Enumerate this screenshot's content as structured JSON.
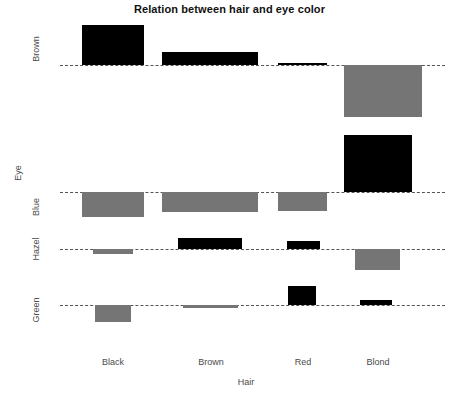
{
  "chart_data": {
    "type": "bar",
    "subtype": "association-plot",
    "title": "Relation between hair and eye color",
    "xlabel": "Hair",
    "ylabel": "Eye",
    "categories": [
      "Black",
      "Brown",
      "Red",
      "Blond"
    ],
    "row_categories": [
      "Brown",
      "Blue",
      "Hazel",
      "Green"
    ],
    "grid": false,
    "legend": null,
    "axis_note": "Dashed horizontal baselines mark zero residual for each eye-color row; black bars point up (positive residual), gray bars point down (negative residual).",
    "series": [
      {
        "name": "Brown",
        "values": [
          12.5,
          5.0,
          0.4,
          -15.7
        ],
        "signs": [
          "positive",
          "positive",
          "positive",
          "negative"
        ]
      },
      {
        "name": "Blue",
        "values": [
          -6.0,
          -4.8,
          -4.4,
          14.0
        ],
        "signs": [
          "negative",
          "negative",
          "negative",
          "positive"
        ]
      },
      {
        "name": "Hazel",
        "values": [
          -1.3,
          2.7,
          2.0,
          -5.0
        ],
        "signs": [
          "negative",
          "positive",
          "positive",
          "negative"
        ]
      },
      {
        "name": "Green",
        "values": [
          -4.1,
          -0.7,
          4.7,
          1.2
        ],
        "signs": [
          "negative",
          "negative",
          "positive",
          "positive"
        ]
      }
    ],
    "colors": {
      "positive": "#000000",
      "negative": "#757575",
      "baseline": "#555555",
      "text": "#4a4a4a",
      "title": "#111111",
      "background": "#ffffff"
    }
  },
  "layout": {
    "columns": [
      {
        "label": "Black",
        "x": 82,
        "width": 62,
        "label_center": 113
      },
      {
        "label": "Brown",
        "x": 162,
        "width": 96,
        "label_center": 211
      },
      {
        "label": "Red",
        "x": 278,
        "width": 49,
        "label_center": 303
      },
      {
        "label": "Blond",
        "x": 344,
        "width": 78,
        "label_center": 378
      }
    ],
    "rows": [
      {
        "label": "Brown",
        "baseline_y": 65,
        "label_y": 50
      },
      {
        "label": "Blue",
        "baseline_y": 192,
        "label_y": 208
      },
      {
        "label": "Hazel",
        "baseline_y": 249,
        "label_y": 250
      },
      {
        "label": "Green",
        "baseline_y": 305,
        "label_y": 311
      }
    ],
    "bars": [
      {
        "row": "Brown",
        "col": "Black",
        "x": 82,
        "width": 62,
        "top": 25,
        "height": 40,
        "sign": "positive"
      },
      {
        "row": "Brown",
        "col": "Brown",
        "x": 162,
        "width": 96,
        "top": 52,
        "height": 13,
        "sign": "positive"
      },
      {
        "row": "Brown",
        "col": "Red",
        "x": 278,
        "width": 49,
        "top": 63,
        "height": 2,
        "sign": "positive"
      },
      {
        "row": "Brown",
        "col": "Blond",
        "x": 344,
        "width": 78,
        "top": 65,
        "height": 52,
        "sign": "negative"
      },
      {
        "row": "Blue",
        "col": "Black",
        "x": 82,
        "width": 62,
        "top": 192,
        "height": 25,
        "sign": "negative"
      },
      {
        "row": "Blue",
        "col": "Brown",
        "x": 162,
        "width": 96,
        "top": 192,
        "height": 20,
        "sign": "negative"
      },
      {
        "row": "Blue",
        "col": "Red",
        "x": 278,
        "width": 49,
        "top": 192,
        "height": 19,
        "sign": "negative"
      },
      {
        "row": "Blue",
        "col": "Blond",
        "x": 344,
        "width": 68,
        "top": 135,
        "height": 57,
        "sign": "positive"
      },
      {
        "row": "Hazel",
        "col": "Black",
        "x": 93,
        "width": 40,
        "top": 249,
        "height": 5,
        "sign": "negative"
      },
      {
        "row": "Hazel",
        "col": "Brown",
        "x": 178,
        "width": 64,
        "top": 238,
        "height": 11,
        "sign": "positive"
      },
      {
        "row": "Hazel",
        "col": "Red",
        "x": 287,
        "width": 33,
        "top": 241,
        "height": 8,
        "sign": "positive"
      },
      {
        "row": "Hazel",
        "col": "Blond",
        "x": 355,
        "width": 45,
        "top": 249,
        "height": 21,
        "sign": "negative"
      },
      {
        "row": "Green",
        "col": "Black",
        "x": 95,
        "width": 36,
        "top": 305,
        "height": 17,
        "sign": "negative"
      },
      {
        "row": "Green",
        "col": "Brown",
        "x": 183,
        "width": 55,
        "top": 305,
        "height": 3,
        "sign": "negative"
      },
      {
        "row": "Green",
        "col": "Red",
        "x": 288,
        "width": 28,
        "top": 286,
        "height": 19,
        "sign": "positive"
      },
      {
        "row": "Green",
        "col": "Blond",
        "x": 360,
        "width": 32,
        "top": 300,
        "height": 5,
        "sign": "positive"
      }
    ]
  },
  "axis_titles": {
    "x": "Hair",
    "y": "Eye"
  },
  "title": "Relation between hair and eye color"
}
